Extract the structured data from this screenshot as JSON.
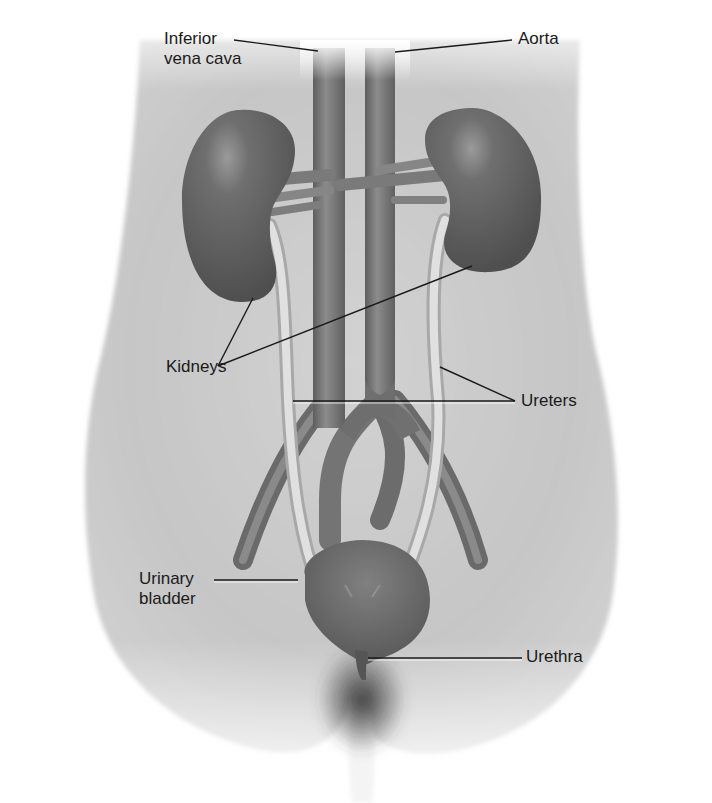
{
  "diagram": {
    "type": "anatomical-illustration",
    "colors": {
      "background": "#ffffff",
      "body": "#c9c9c9",
      "organ": "#6a6a6a",
      "vessel": "#7c7c7c",
      "ureter": "#d8d8d8",
      "label_text": "#1a1a1a",
      "leader_line": "#1a1a1a"
    },
    "labels": [
      {
        "id": "inferior-vena-cava",
        "text": "Inferior\nvena cava",
        "x": 164,
        "y": 29,
        "align": "left",
        "leader": {
          "x1": 234,
          "y1": 40,
          "x2": 318,
          "y2": 51
        }
      },
      {
        "id": "aorta",
        "text": "Aorta",
        "x": 518,
        "y": 29,
        "align": "left",
        "leader": {
          "x1": 512,
          "y1": 40,
          "x2": 395,
          "y2": 52
        }
      },
      {
        "id": "kidneys",
        "text": "Kidneys",
        "x": 166,
        "y": 361,
        "align": "left",
        "leader_a": {
          "x1": 218,
          "y1": 366,
          "x2": 253,
          "y2": 298
        },
        "leader_b": {
          "x1": 218,
          "y1": 366,
          "x2": 472,
          "y2": 266
        }
      },
      {
        "id": "ureters",
        "text": "Ureters",
        "x": 521,
        "y": 392,
        "align": "left",
        "leader_a": {
          "x1": 515,
          "y1": 401,
          "x2": 440,
          "y2": 367
        },
        "leader_b": {
          "x1": 515,
          "y1": 401,
          "x2": 293,
          "y2": 401
        }
      },
      {
        "id": "urinary-bladder",
        "text": "Urinary\nbladder",
        "x": 139,
        "y": 569,
        "align": "left",
        "leader": {
          "x1": 214,
          "y1": 580,
          "x2": 298,
          "y2": 580
        }
      },
      {
        "id": "urethra",
        "text": "Urethra",
        "x": 526,
        "y": 646,
        "align": "left",
        "leader": {
          "x1": 522,
          "y1": 658,
          "x2": 368,
          "y2": 658
        }
      }
    ]
  }
}
